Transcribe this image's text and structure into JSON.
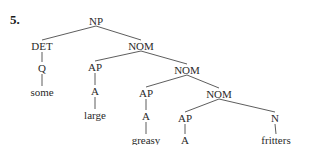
{
  "example_number": "5.",
  "tree": {
    "nodes": [
      {
        "id": "np",
        "label": "NP",
        "x": 96,
        "y": 21,
        "type": "phrase"
      },
      {
        "id": "det",
        "label": "DET",
        "x": 42,
        "y": 46,
        "type": "phrase"
      },
      {
        "id": "nom1",
        "label": "NOM",
        "x": 141,
        "y": 46,
        "type": "phrase"
      },
      {
        "id": "q",
        "label": "Q",
        "x": 42,
        "y": 68,
        "type": "category"
      },
      {
        "id": "ap1",
        "label": "AP",
        "x": 95,
        "y": 67,
        "type": "phrase"
      },
      {
        "id": "nom2",
        "label": "NOM",
        "x": 187,
        "y": 70,
        "type": "phrase"
      },
      {
        "id": "w_some",
        "label": "some",
        "x": 42,
        "y": 92,
        "type": "word"
      },
      {
        "id": "a1",
        "label": "A",
        "x": 95,
        "y": 91,
        "type": "category"
      },
      {
        "id": "ap2",
        "label": "AP",
        "x": 146,
        "y": 93,
        "type": "phrase"
      },
      {
        "id": "nom3",
        "label": "NOM",
        "x": 219,
        "y": 94,
        "type": "phrase"
      },
      {
        "id": "w_large",
        "label": "large",
        "x": 95,
        "y": 115,
        "type": "word"
      },
      {
        "id": "a2",
        "label": "A",
        "x": 146,
        "y": 116,
        "type": "category"
      },
      {
        "id": "ap3",
        "label": "AP",
        "x": 185,
        "y": 118,
        "type": "phrase"
      },
      {
        "id": "n",
        "label": "N",
        "x": 275,
        "y": 118,
        "type": "category"
      },
      {
        "id": "w_greasy",
        "label": "greasy",
        "x": 146,
        "y": 140,
        "type": "word"
      },
      {
        "id": "a3",
        "label": "A",
        "x": 185,
        "y": 140,
        "type": "category"
      },
      {
        "id": "w_fritters",
        "label": "fritters",
        "x": 276,
        "y": 140,
        "type": "word"
      }
    ],
    "edges": [
      [
        "np",
        "det"
      ],
      [
        "np",
        "nom1"
      ],
      [
        "det",
        "q"
      ],
      [
        "q",
        "w_some"
      ],
      [
        "nom1",
        "ap1"
      ],
      [
        "nom1",
        "nom2"
      ],
      [
        "ap1",
        "a1"
      ],
      [
        "a1",
        "w_large"
      ],
      [
        "nom2",
        "ap2"
      ],
      [
        "nom2",
        "nom3"
      ],
      [
        "ap2",
        "a2"
      ],
      [
        "a2",
        "w_greasy"
      ],
      [
        "nom3",
        "ap3"
      ],
      [
        "nom3",
        "n"
      ],
      [
        "ap3",
        "a3"
      ],
      [
        "n",
        "w_fritters"
      ]
    ],
    "line_color": "#333333"
  }
}
